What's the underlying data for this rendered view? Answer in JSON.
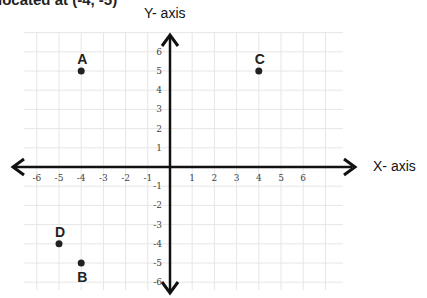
{
  "caption": "located at (-4, -5)",
  "axes": {
    "x_title": "X- axis",
    "y_title": "Y- axis",
    "x_ticks": [
      "-6",
      "-5",
      "-4",
      "-3",
      "-2",
      "-1",
      "1",
      "2",
      "3",
      "4",
      "5",
      "6"
    ],
    "y_ticks": [
      "6",
      "5",
      "4",
      "3",
      "2",
      "1",
      "-1",
      "-2",
      "-3",
      "-4",
      "-5",
      "-6"
    ]
  },
  "points": [
    {
      "label": "A",
      "x": -4,
      "y": 5
    },
    {
      "label": "B",
      "x": -4,
      "y": -5
    },
    {
      "label": "C",
      "x": 4,
      "y": 5
    },
    {
      "label": "D",
      "x": -5,
      "y": -4
    }
  ],
  "chart_data": {
    "type": "scatter",
    "title": "",
    "xlabel": "X- axis",
    "ylabel": "Y- axis",
    "xlim": [
      -6,
      6
    ],
    "ylim": [
      -6,
      6
    ],
    "grid": true,
    "series": [
      {
        "name": "A",
        "x": [
          -4
        ],
        "y": [
          5
        ]
      },
      {
        "name": "B",
        "x": [
          -4
        ],
        "y": [
          -5
        ]
      },
      {
        "name": "C",
        "x": [
          4
        ],
        "y": [
          5
        ]
      },
      {
        "name": "D",
        "x": [
          -5
        ],
        "y": [
          -4
        ]
      }
    ]
  }
}
